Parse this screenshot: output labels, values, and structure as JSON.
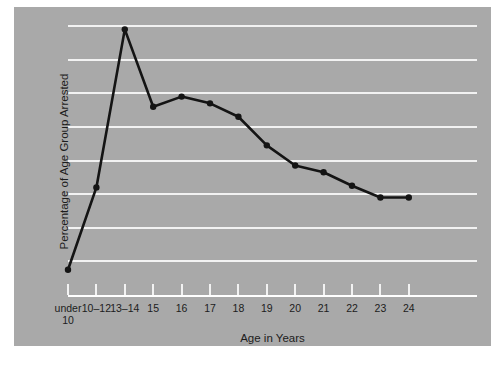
{
  "chart_data": {
    "type": "line",
    "title": "",
    "xlabel": "Age in  Years",
    "ylabel": "Percentage of Age Group Arrested",
    "categories": [
      "under\n10",
      "10–12",
      "13–14",
      "15",
      "16",
      "17",
      "18",
      "19",
      "20",
      "21",
      "22",
      "23",
      "24"
    ],
    "category_labels": [
      {
        "line1": "under",
        "line2": "10"
      },
      {
        "line1": "10–12",
        "line2": ""
      },
      {
        "line1": "13–14",
        "line2": ""
      },
      {
        "line1": "15",
        "line2": ""
      },
      {
        "line1": "16",
        "line2": ""
      },
      {
        "line1": "17",
        "line2": ""
      },
      {
        "line1": "18",
        "line2": ""
      },
      {
        "line1": "19",
        "line2": ""
      },
      {
        "line1": "20",
        "line2": ""
      },
      {
        "line1": "21",
        "line2": ""
      },
      {
        "line1": "22",
        "line2": ""
      },
      {
        "line1": "23",
        "line2": ""
      },
      {
        "line1": "24",
        "line2": ""
      }
    ],
    "values": [
      0.75,
      3.2,
      7.9,
      5.6,
      5.9,
      5.7,
      5.3,
      4.45,
      3.85,
      3.65,
      3.25,
      2.9,
      2.9
    ],
    "ylim": [
      0,
      8
    ],
    "ytick_labels": [
      "0",
      "1",
      "2",
      "3",
      "4",
      "5",
      "6",
      "7",
      "8"
    ],
    "yticks": [
      0,
      1,
      2,
      3,
      4,
      5,
      6,
      7,
      8
    ],
    "grid": true,
    "legend": "none",
    "markers": true,
    "colors": {
      "panel_background": "#a9a9a9",
      "figure_background": "#ffffff",
      "gridline": "#f2f2f2",
      "series_line": "#141414",
      "marker": "#141414",
      "text": "#1c1c1c"
    }
  }
}
